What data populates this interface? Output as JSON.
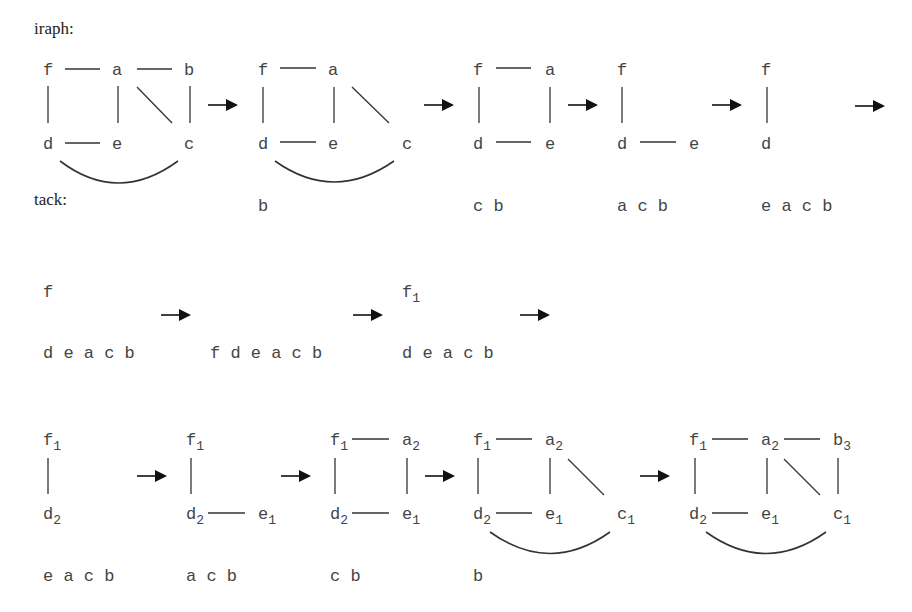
{
  "labels": {
    "graph": "iraph:",
    "stack": "tack:"
  },
  "row1": {
    "panels": [
      {
        "nodes": {
          "f": "f",
          "a": "a",
          "b": "b",
          "d": "d",
          "e": "e",
          "c": "c"
        },
        "stack": ""
      },
      {
        "nodes": {
          "f": "f",
          "a": "a",
          "d": "d",
          "e": "e",
          "c": "c"
        },
        "stack": "b"
      },
      {
        "nodes": {
          "f": "f",
          "a": "a",
          "d": "d",
          "e": "e"
        },
        "stack": "c b"
      },
      {
        "nodes": {
          "f": "f",
          "d": "d",
          "e": "e"
        },
        "stack": "a c b"
      },
      {
        "nodes": {
          "f": "f",
          "d": "d"
        },
        "stack": "e a c b"
      }
    ]
  },
  "row2": {
    "panels": [
      {
        "nodes": {
          "f": "f"
        },
        "stack": "d e a c b"
      },
      {
        "nodes": {},
        "stack": "f d e a c b"
      },
      {
        "nodes": {
          "f": "f",
          "f_sub": "1"
        },
        "stack": "d e a c b"
      }
    ]
  },
  "row3": {
    "panels": [
      {
        "nodes": {
          "f": "f",
          "f_sub": "1",
          "d": "d",
          "d_sub": "2"
        },
        "stack": "e a c b"
      },
      {
        "nodes": {
          "f": "f",
          "f_sub": "1",
          "d": "d",
          "d_sub": "2",
          "e": "e",
          "e_sub": "1"
        },
        "stack": "a c b"
      },
      {
        "nodes": {
          "f": "f",
          "f_sub": "1",
          "a": "a",
          "a_sub": "2",
          "d": "d",
          "d_sub": "2",
          "e": "e",
          "e_sub": "1"
        },
        "stack": "c b"
      },
      {
        "nodes": {
          "f": "f",
          "f_sub": "1",
          "a": "a",
          "a_sub": "2",
          "d": "d",
          "d_sub": "2",
          "e": "e",
          "e_sub": "1",
          "c": "c",
          "c_sub": "1"
        },
        "stack": "b"
      },
      {
        "nodes": {
          "f": "f",
          "f_sub": "1",
          "a": "a",
          "a_sub": "2",
          "b": "b",
          "b_sub": "3",
          "d": "d",
          "d_sub": "2",
          "e": "e",
          "e_sub": "1",
          "c": "c",
          "c_sub": "1"
        },
        "stack": ""
      }
    ]
  }
}
